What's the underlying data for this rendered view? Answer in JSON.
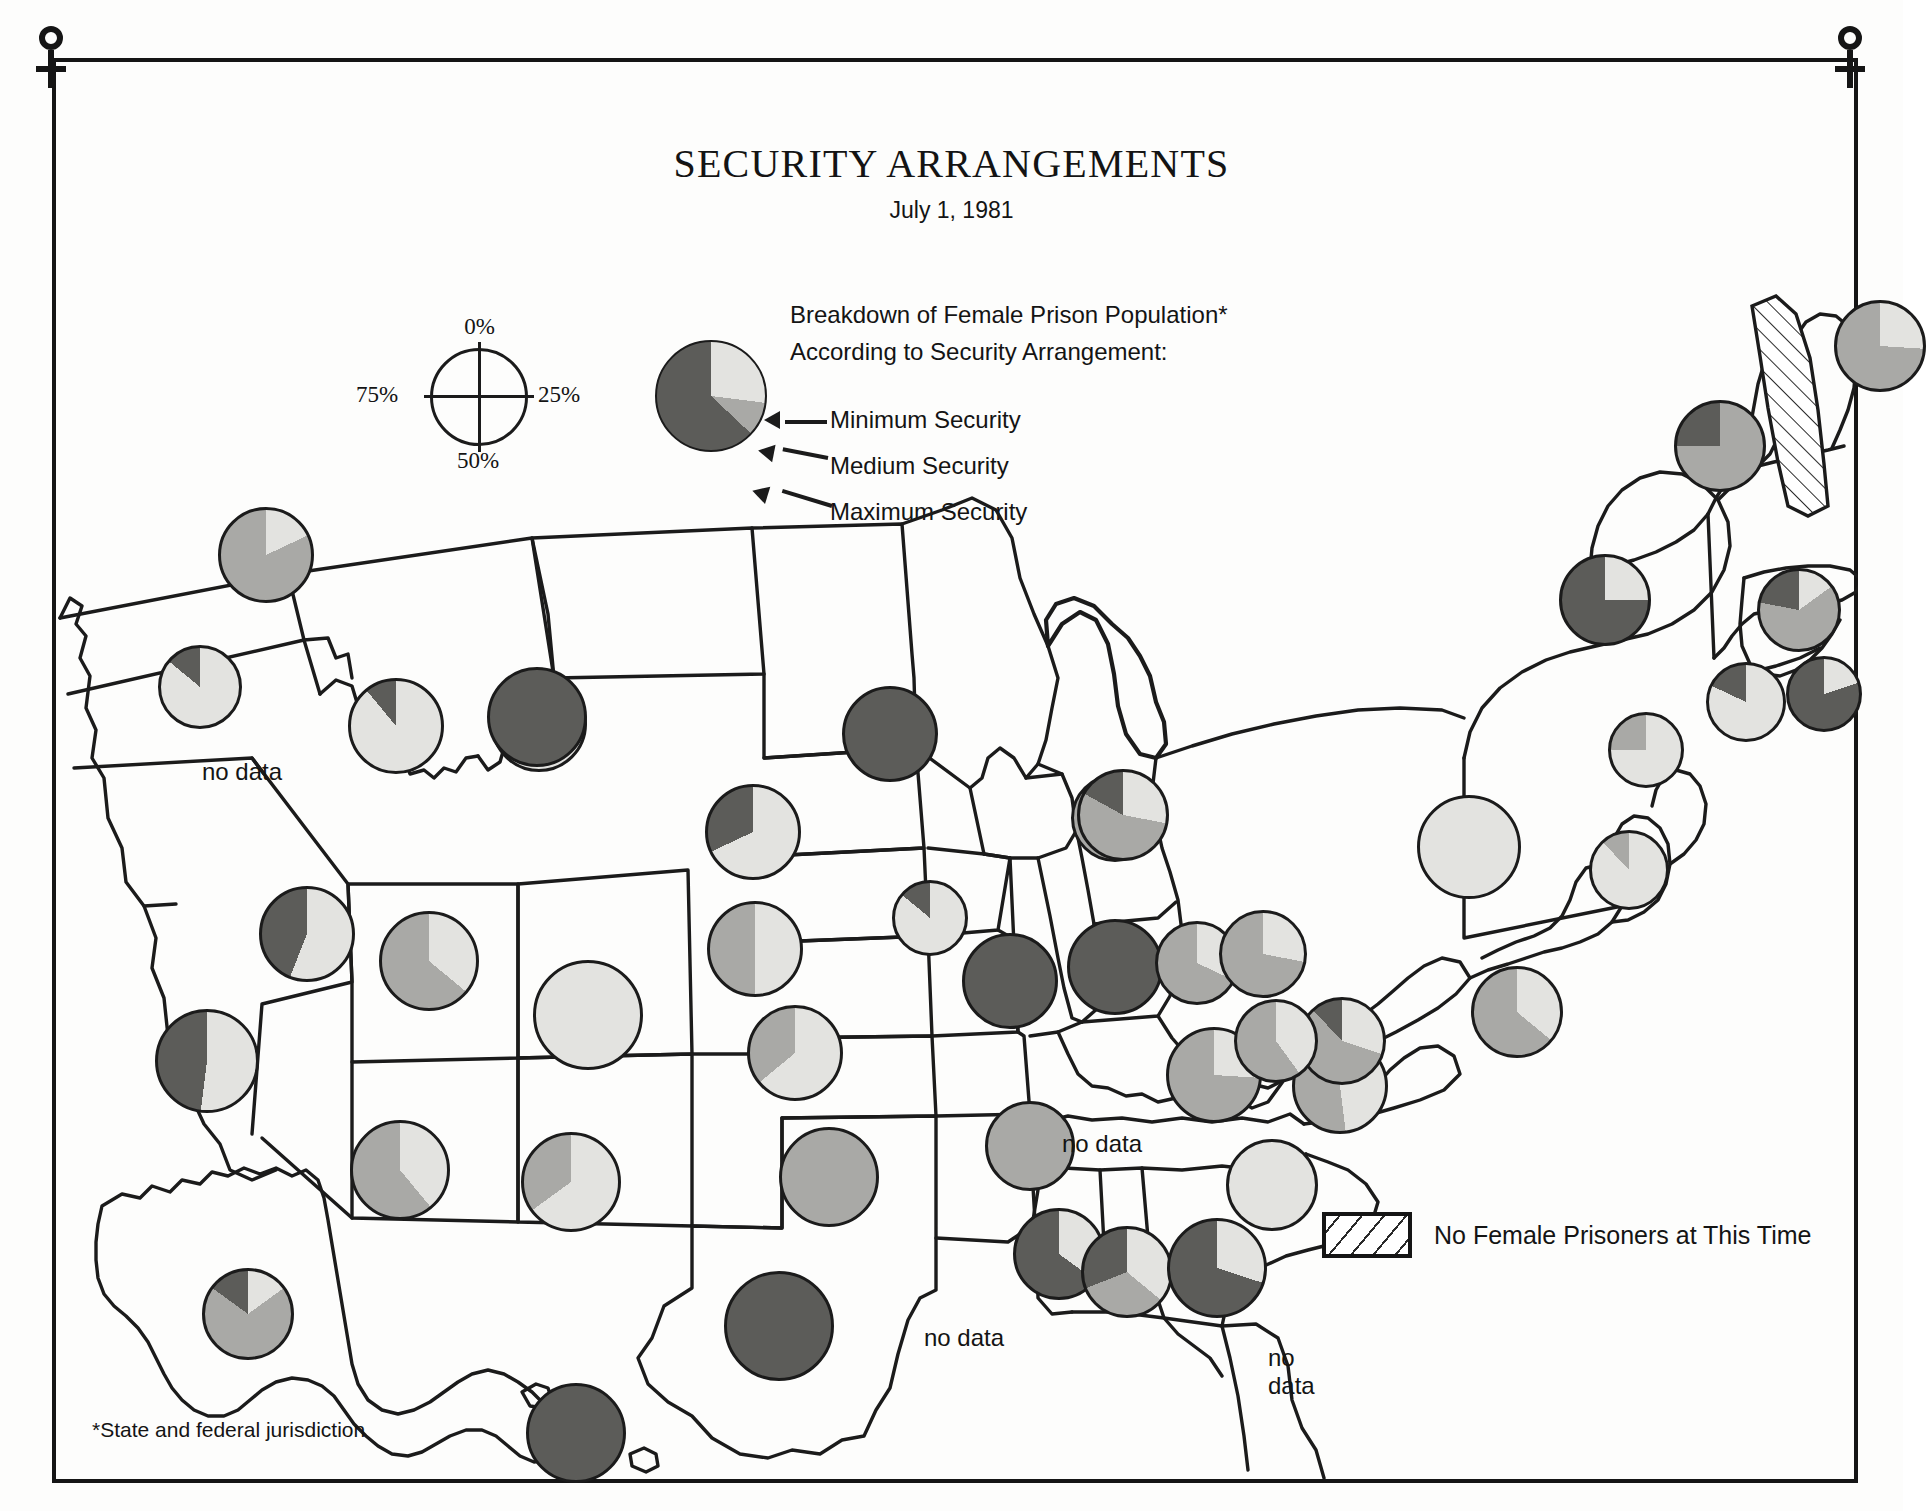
{
  "page": {
    "title": "SECURITY ARRANGEMENTS",
    "subtitle": "July 1, 1981",
    "footnote": "*State and federal jurisdiction"
  },
  "percent_key": {
    "top": "0%",
    "right": "25%",
    "bottom": "50%",
    "left": "75%"
  },
  "legend": {
    "heading_line1": "Breakdown of Female Prison Population*",
    "heading_line2": "According to Security Arrangement:",
    "categories": [
      {
        "name": "Minimum Security",
        "color": "#e3e3e0"
      },
      {
        "name": "Medium Security",
        "color": "#a9a9a6"
      },
      {
        "name": "Maximum Security",
        "color": "#5c5c59"
      }
    ],
    "sample_pie": {
      "minimum": 27,
      "medium": 10,
      "maximum": 63
    },
    "no_prisoners": {
      "label": "No Female Prisoners at This Time",
      "pattern": "diagonal-hatch"
    },
    "no_data_label": "no data"
  },
  "colors": {
    "minimum": "#e3e3e0",
    "medium": "#a9a9a6",
    "maximum": "#5c5c59",
    "outline": "#1b1b1b",
    "paper": "#fdfdfc"
  },
  "chart_data": {
    "type": "pie",
    "title": "SECURITY ARRANGEMENTS",
    "subtitle": "July 1, 1981",
    "units": "percent of state female prison population",
    "series_names": [
      "Minimum Security",
      "Medium Security",
      "Maximum Security"
    ],
    "series_colors": [
      "#e3e3e0",
      "#a9a9a6",
      "#5c5c59"
    ],
    "legend_position": "top-center",
    "states": [
      {
        "state": "Washington",
        "abbr": "WA",
        "x": 214,
        "y": 497,
        "r": 48,
        "minimum": 18,
        "medium": 82,
        "maximum": 0,
        "status": "data"
      },
      {
        "state": "Oregon",
        "abbr": "OR",
        "x": 148,
        "y": 629,
        "r": 42,
        "minimum": 86,
        "medium": 0,
        "maximum": 14,
        "status": "data"
      },
      {
        "state": "California",
        "abbr": "CA",
        "x": 155,
        "y": 1003,
        "r": 52,
        "minimum": 52,
        "medium": 0,
        "maximum": 48,
        "status": "data"
      },
      {
        "state": "Nevada",
        "abbr": "NV",
        "x": 255,
        "y": 876,
        "r": 48,
        "minimum": 56,
        "medium": 0,
        "maximum": 44,
        "status": "data"
      },
      {
        "state": "Idaho",
        "abbr": "ID",
        "x": 344,
        "y": 668,
        "r": 48,
        "minimum": 89,
        "medium": 0,
        "maximum": 11,
        "status": "data"
      },
      {
        "state": "Montana",
        "abbr": "MT",
        "x": 180,
        "y": 720,
        "r": 0,
        "minimum": 0,
        "medium": 0,
        "maximum": 0,
        "status": "no data"
      },
      {
        "state": "Wyoming",
        "abbr": "WY",
        "x": 487,
        "y": 666,
        "r": 48,
        "minimum": 60,
        "medium": 27,
        "maximum": 13,
        "status": "data"
      },
      {
        "state": "Utah",
        "abbr": "UT",
        "x": 377,
        "y": 903,
        "r": 50,
        "minimum": 36,
        "medium": 64,
        "maximum": 0,
        "status": "data"
      },
      {
        "state": "Arizona",
        "abbr": "AZ",
        "x": 348,
        "y": 1112,
        "r": 50,
        "minimum": 39,
        "medium": 61,
        "maximum": 0,
        "status": "data"
      },
      {
        "state": "Colorado",
        "abbr": "CO",
        "x": 536,
        "y": 957,
        "r": 55,
        "minimum": 100,
        "medium": 0,
        "maximum": 0,
        "status": "data"
      },
      {
        "state": "New Mexico",
        "abbr": "NM",
        "x": 519,
        "y": 1124,
        "r": 50,
        "minimum": 65,
        "medium": 35,
        "maximum": 0,
        "status": "data"
      },
      {
        "state": "North Dakota",
        "abbr": "ND",
        "x": 485,
        "y": 659,
        "r": 50,
        "minimum": 0,
        "medium": 0,
        "maximum": 100,
        "status": "data"
      },
      {
        "state": "South Dakota",
        "abbr": "SD",
        "x": 701,
        "y": 774,
        "r": 48,
        "minimum": 68,
        "medium": 0,
        "maximum": 32,
        "status": "data"
      },
      {
        "state": "Nebraska",
        "abbr": "NE",
        "x": 703,
        "y": 891,
        "r": 48,
        "minimum": 50,
        "medium": 50,
        "maximum": 0,
        "status": "data"
      },
      {
        "state": "Kansas",
        "abbr": "KS",
        "x": 743,
        "y": 995,
        "r": 48,
        "minimum": 64,
        "medium": 36,
        "maximum": 0,
        "status": "data"
      },
      {
        "state": "Oklahoma",
        "abbr": "OK",
        "x": 777,
        "y": 1119,
        "r": 50,
        "minimum": 0,
        "medium": 100,
        "maximum": 0,
        "status": "data"
      },
      {
        "state": "Texas",
        "abbr": "TX",
        "x": 727,
        "y": 1268,
        "r": 55,
        "minimum": 0,
        "medium": 0,
        "maximum": 100,
        "status": "data"
      },
      {
        "state": "Minnesota",
        "abbr": "MN",
        "x": 838,
        "y": 676,
        "r": 48,
        "minimum": 0,
        "medium": 0,
        "maximum": 100,
        "status": "data"
      },
      {
        "state": "Iowa",
        "abbr": "IA",
        "x": 878,
        "y": 860,
        "r": 38,
        "minimum": 86,
        "medium": 0,
        "maximum": 14,
        "status": "data"
      },
      {
        "state": "Missouri",
        "abbr": "MO",
        "x": 958,
        "y": 923,
        "r": 48,
        "minimum": 0,
        "medium": 0,
        "maximum": 100,
        "status": "data"
      },
      {
        "state": "Arkansas",
        "abbr": "AR",
        "x": 978,
        "y": 1088,
        "r": 45,
        "minimum": 0,
        "medium": 100,
        "maximum": 0,
        "status": "data"
      },
      {
        "state": "Louisiana",
        "abbr": "LA",
        "x": 920,
        "y": 1280,
        "r": 0,
        "minimum": 0,
        "medium": 0,
        "maximum": 0,
        "status": "no data"
      },
      {
        "state": "Wisconsin",
        "abbr": "WI",
        "x": 1063,
        "y": 760,
        "r": 44,
        "minimum": 20,
        "medium": 65,
        "maximum": 15,
        "status": "data"
      },
      {
        "state": "Illinois",
        "abbr": "IL",
        "x": 1063,
        "y": 909,
        "r": 48,
        "minimum": 0,
        "medium": 0,
        "maximum": 100,
        "status": "data"
      },
      {
        "state": "Michigan",
        "abbr": "MI",
        "x": 1071,
        "y": 757,
        "r": 46,
        "minimum": 28,
        "medium": 55,
        "maximum": 17,
        "status": "data"
      },
      {
        "state": "Indiana",
        "abbr": "IN",
        "x": 1145,
        "y": 905,
        "r": 42,
        "minimum": 32,
        "medium": 68,
        "maximum": 0,
        "status": "data"
      },
      {
        "state": "Ohio",
        "abbr": "OH",
        "x": 1211,
        "y": 896,
        "r": 44,
        "minimum": 28,
        "medium": 72,
        "maximum": 0,
        "status": "data"
      },
      {
        "state": "Kentucky",
        "abbr": "KY",
        "x": 1162,
        "y": 1017,
        "r": 48,
        "minimum": 26,
        "medium": 74,
        "maximum": 0,
        "status": "data"
      },
      {
        "state": "Tennessee",
        "abbr": "TN",
        "x": 1080,
        "y": 1092,
        "r": 0,
        "minimum": 0,
        "medium": 0,
        "maximum": 0,
        "status": "no data"
      },
      {
        "state": "Mississippi",
        "abbr": "MS",
        "x": 1007,
        "y": 1196,
        "r": 46,
        "minimum": 35,
        "medium": 0,
        "maximum": 65,
        "status": "data"
      },
      {
        "state": "Alabama",
        "abbr": "AL",
        "x": 1075,
        "y": 1214,
        "r": 46,
        "minimum": 36,
        "medium": 33,
        "maximum": 31,
        "status": "data"
      },
      {
        "state": "Georgia",
        "abbr": "GA",
        "x": 1165,
        "y": 1210,
        "r": 50,
        "minimum": 30,
        "medium": 0,
        "maximum": 70,
        "status": "data"
      },
      {
        "state": "Florida",
        "abbr": "FL",
        "x": 1248,
        "y": 1320,
        "r": 0,
        "minimum": 0,
        "medium": 0,
        "maximum": 0,
        "status": "no data"
      },
      {
        "state": "South Carolina",
        "abbr": "SC",
        "x": 1220,
        "y": 1127,
        "r": 46,
        "minimum": 100,
        "medium": 0,
        "maximum": 0,
        "status": "data"
      },
      {
        "state": "North Carolina",
        "abbr": "NC",
        "x": 1288,
        "y": 1028,
        "r": 48,
        "minimum": 48,
        "medium": 52,
        "maximum": 0,
        "status": "data"
      },
      {
        "state": "Virginia",
        "abbr": "VA",
        "x": 1290,
        "y": 983,
        "r": 44,
        "minimum": 30,
        "medium": 58,
        "maximum": 12,
        "status": "data"
      },
      {
        "state": "West Virginia",
        "abbr": "WV",
        "x": 1224,
        "y": 983,
        "r": 42,
        "minimum": 40,
        "medium": 60,
        "maximum": 0,
        "status": "data"
      },
      {
        "state": "Maryland",
        "abbr": "MD",
        "x": 1465,
        "y": 954,
        "r": 46,
        "minimum": 36,
        "medium": 64,
        "maximum": 0,
        "status": "data"
      },
      {
        "state": "Delaware",
        "abbr": "DE",
        "x": 1577,
        "y": 812,
        "r": 40,
        "minimum": 88,
        "medium": 12,
        "maximum": 0,
        "status": "data"
      },
      {
        "state": "Pennsylvania",
        "abbr": "PA",
        "x": 1417,
        "y": 789,
        "r": 52,
        "minimum": 100,
        "medium": 0,
        "maximum": 0,
        "status": "data"
      },
      {
        "state": "New Jersey",
        "abbr": "NJ",
        "x": 1594,
        "y": 692,
        "r": 38,
        "minimum": 75,
        "medium": 25,
        "maximum": 0,
        "status": "data"
      },
      {
        "state": "New York",
        "abbr": "NY",
        "x": 1553,
        "y": 542,
        "r": 46,
        "minimum": 25,
        "medium": 0,
        "maximum": 75,
        "status": "data"
      },
      {
        "state": "Connecticut",
        "abbr": "CT",
        "x": 1694,
        "y": 644,
        "r": 40,
        "minimum": 82,
        "medium": 0,
        "maximum": 18,
        "status": "data"
      },
      {
        "state": "Rhode Island",
        "abbr": "RI",
        "x": 1772,
        "y": 636,
        "r": 38,
        "minimum": 20,
        "medium": 0,
        "maximum": 80,
        "status": "data"
      },
      {
        "state": "Massachusetts",
        "abbr": "MA",
        "x": 1747,
        "y": 552,
        "r": 42,
        "minimum": 15,
        "medium": 63,
        "maximum": 22,
        "status": "data"
      },
      {
        "state": "Vermont",
        "abbr": "VT",
        "x": 1668,
        "y": 388,
        "r": 46,
        "minimum": 0,
        "medium": 75,
        "maximum": 25,
        "status": "data"
      },
      {
        "state": "New Hampshire",
        "abbr": "NH",
        "x": 1745,
        "y": 390,
        "r": 0,
        "minimum": 0,
        "medium": 0,
        "maximum": 0,
        "status": "no prisoners"
      },
      {
        "state": "Maine",
        "abbr": "ME",
        "x": 1828,
        "y": 288,
        "r": 46,
        "minimum": 26,
        "medium": 74,
        "maximum": 0,
        "status": "data"
      },
      {
        "state": "Alaska",
        "abbr": "AK",
        "x": 196,
        "y": 1256,
        "r": 46,
        "minimum": 15,
        "medium": 70,
        "maximum": 15,
        "status": "data"
      },
      {
        "state": "Hawaii",
        "abbr": "HI",
        "x": 524,
        "y": 1375,
        "r": 50,
        "minimum": 0,
        "medium": 0,
        "maximum": 100,
        "status": "data"
      }
    ],
    "no_data_annotations": [
      {
        "label": "no data",
        "state": "Montana",
        "x": 150,
        "y": 700
      },
      {
        "label": "no data",
        "state": "Tennessee",
        "x": 1010,
        "y": 1072
      },
      {
        "label": "no data",
        "state": "Louisiana",
        "x": 872,
        "y": 1266
      },
      {
        "label": "no\ndata",
        "state": "Florida",
        "x": 1216,
        "y": 1286
      }
    ]
  }
}
